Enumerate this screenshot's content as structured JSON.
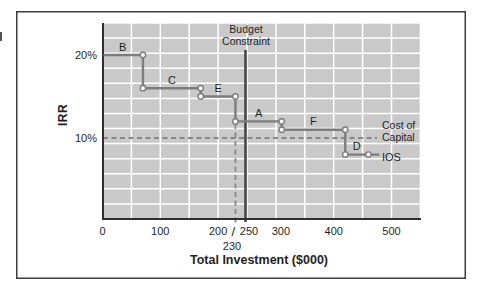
{
  "figure": {
    "y_axis_title": "IRR",
    "x_axis_title": "Total Investment ($000)",
    "budget_constraint_label": "Budget Constraint",
    "cost_of_capital_label": "Cost of Capital",
    "ios_label": "IOS"
  },
  "chart_data": {
    "type": "line",
    "subtype": "step-function-investment-opportunities-schedule",
    "title": "",
    "xlabel": "Total Investment ($000)",
    "ylabel": "IRR",
    "xlim": [
      0,
      550
    ],
    "ylim": [
      0,
      24
    ],
    "grid": true,
    "legend_position": "none",
    "x_tick_values": [
      0,
      100,
      200,
      250,
      300,
      400,
      500
    ],
    "x_tick_labels": [
      "0",
      "100",
      "200",
      "250",
      "300",
      "400",
      "500"
    ],
    "y_tick_values": [
      20,
      10
    ],
    "y_tick_labels": [
      "20%",
      "10%"
    ],
    "series": [
      {
        "name": "IOS",
        "projects": [
          {
            "label": "B",
            "irr_pct": 20,
            "cum_invest_start": 0,
            "cum_invest_end": 70
          },
          {
            "label": "C",
            "irr_pct": 16,
            "cum_invest_start": 70,
            "cum_invest_end": 170
          },
          {
            "label": "E",
            "irr_pct": 15,
            "cum_invest_start": 170,
            "cum_invest_end": 230
          },
          {
            "label": "A",
            "irr_pct": 12,
            "cum_invest_start": 230,
            "cum_invest_end": 310
          },
          {
            "label": "F",
            "irr_pct": 11,
            "cum_invest_start": 310,
            "cum_invest_end": 420
          },
          {
            "label": "D",
            "irr_pct": 8,
            "cum_invest_start": 420,
            "cum_invest_end": 460
          }
        ]
      }
    ],
    "budget_constraint_value": 250,
    "cum_invest_at_budget_label": "230",
    "budget_slash": "/",
    "cost_of_capital_pct": 10
  },
  "colors": {
    "plot_bg": "#c9c9c9",
    "grid": "#ffffff",
    "step_line": "#7d7d7d",
    "marker_fill": "#ffffff",
    "axis": "#2e2e2e",
    "budget_line": "#474747",
    "dashed": "#878787",
    "border": "#3c3c3c",
    "text": "#1f1f1f"
  }
}
